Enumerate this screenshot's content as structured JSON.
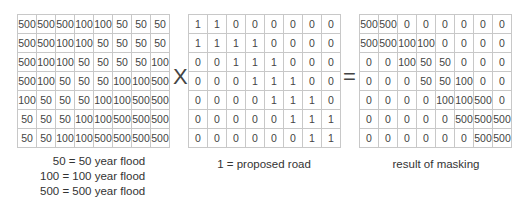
{
  "grids": [
    {
      "name": "flood-zones",
      "rows": [
        [
          "500",
          "500",
          "500",
          "100",
          "100",
          "50",
          "50",
          "50"
        ],
        [
          "500",
          "500",
          "100",
          "100",
          "50",
          "50",
          "50",
          "50"
        ],
        [
          "500",
          "100",
          "100",
          "50",
          "50",
          "50",
          "50",
          "100"
        ],
        [
          "500",
          "100",
          "50",
          "50",
          "50",
          "100",
          "100",
          "500"
        ],
        [
          "100",
          "50",
          "50",
          "50",
          "100",
          "100",
          "500",
          "500"
        ],
        [
          "50",
          "50",
          "50",
          "100",
          "100",
          "500",
          "500",
          "500"
        ],
        [
          "50",
          "50",
          "100",
          "100",
          "500",
          "500",
          "500",
          "500"
        ]
      ]
    },
    {
      "name": "proposed-road-mask",
      "rows": [
        [
          "1",
          "1",
          "0",
          "0",
          "0",
          "0",
          "0",
          "0"
        ],
        [
          "1",
          "1",
          "1",
          "1",
          "0",
          "0",
          "0",
          "0"
        ],
        [
          "0",
          "0",
          "1",
          "1",
          "1",
          "0",
          "0",
          "0"
        ],
        [
          "0",
          "0",
          "0",
          "1",
          "1",
          "1",
          "0",
          "0"
        ],
        [
          "0",
          "0",
          "0",
          "0",
          "1",
          "1",
          "1",
          "0"
        ],
        [
          "0",
          "0",
          "0",
          "0",
          "0",
          "1",
          "1",
          "1"
        ],
        [
          "0",
          "0",
          "0",
          "0",
          "0",
          "0",
          "1",
          "1"
        ]
      ]
    },
    {
      "name": "masking-result",
      "rows": [
        [
          "500",
          "500",
          "0",
          "0",
          "0",
          "0",
          "0",
          "0"
        ],
        [
          "500",
          "500",
          "100",
          "100",
          "0",
          "0",
          "0",
          "0"
        ],
        [
          "0",
          "0",
          "100",
          "50",
          "50",
          "0",
          "0",
          "0"
        ],
        [
          "0",
          "0",
          "0",
          "50",
          "50",
          "100",
          "0",
          "0"
        ],
        [
          "0",
          "0",
          "0",
          "0",
          "100",
          "100",
          "500",
          "0"
        ],
        [
          "0",
          "0",
          "0",
          "0",
          "0",
          "500",
          "500",
          "500"
        ],
        [
          "0",
          "0",
          "0",
          "0",
          "0",
          "0",
          "500",
          "500"
        ]
      ]
    }
  ],
  "operators": {
    "multiply": "X",
    "equals": "="
  },
  "legend": [
    "50  = 50 year flood",
    "100  = 100 year flood",
    "500  = 500 year flood"
  ],
  "captions": {
    "mask": "1 = proposed road",
    "result": "result of masking"
  }
}
